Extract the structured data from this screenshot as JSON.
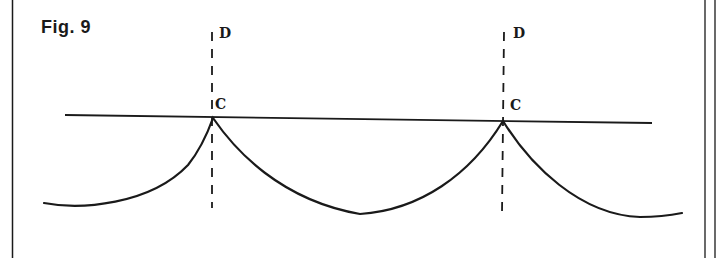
{
  "figure": {
    "title": "Fig.  9",
    "labels": {
      "d_left": "D",
      "c_left": "C",
      "d_right": "D",
      "c_right": "C"
    },
    "colors": {
      "ink": "#1a1a1a",
      "background": "#ffffff"
    }
  }
}
